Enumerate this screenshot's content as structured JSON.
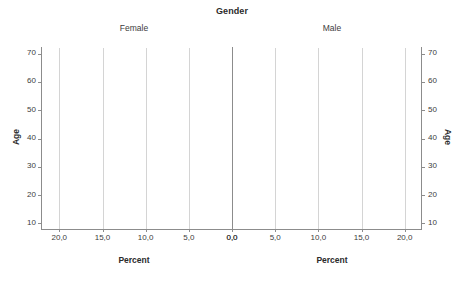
{
  "chart_data": {
    "type": "bar",
    "subtype": "population-pyramid",
    "title": "Gender",
    "panels": [
      {
        "name": "Female",
        "label": "Female",
        "direction": "left",
        "color": "#3a3a3a"
      },
      {
        "name": "Male",
        "label": "Male",
        "direction": "right",
        "color": "#7d7d7d"
      }
    ],
    "xlabel": "Percent",
    "ylabel": "Age",
    "xlim": [
      0,
      22
    ],
    "ylim": [
      8,
      72
    ],
    "xticks": [
      0,
      5,
      10,
      15,
      20
    ],
    "xticklabels": [
      "0,0",
      "5,0",
      "10,0",
      "15,0",
      "20,0"
    ],
    "yticks": [
      10,
      20,
      30,
      40,
      50,
      60,
      70
    ],
    "yticklabels": [
      "10",
      "20",
      "30",
      "40",
      "50",
      "60",
      "70"
    ],
    "grid": true,
    "grid_axis": "x",
    "legend": "none",
    "bin_width": 2,
    "categories": [
      18,
      20,
      22,
      24,
      26,
      28,
      30,
      32,
      34,
      36,
      38,
      40,
      42,
      46,
      52,
      56,
      60
    ],
    "series": [
      {
        "name": "Female",
        "values": [
          4.6,
          13.4,
          11.5,
          18.0,
          8.6,
          4.6,
          4.6,
          2.2,
          8.8,
          6.7,
          2.2,
          2.2,
          0.0,
          0.0,
          2.1,
          0.0,
          2.0
        ]
      },
      {
        "name": "Male",
        "values": [
          1.3,
          13.9,
          11.0,
          12.5,
          11.0,
          8.3,
          7.0,
          4.1,
          5.5,
          1.1,
          1.1,
          1.3,
          2.7,
          1.2,
          1.2,
          1.2,
          0.0
        ]
      }
    ]
  },
  "axes": {
    "female_xtitle": "Percent",
    "male_xtitle": "Percent",
    "left_ytitle": "Age",
    "right_ytitle": "Age"
  }
}
